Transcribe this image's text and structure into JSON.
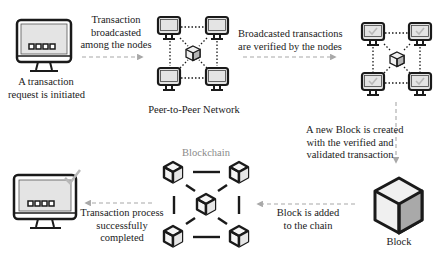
{
  "diagram": {
    "steps": [
      {
        "id": "request",
        "lines": [
          "A transaction",
          "request is initiated"
        ]
      },
      {
        "id": "broadcast",
        "lines": [
          "Transaction",
          "broadcasted",
          "among the nodes"
        ]
      },
      {
        "id": "p2p",
        "lines": [
          "Peer-to-Peer Network"
        ]
      },
      {
        "id": "verify",
        "lines": [
          "Broadcasted transactions",
          "are verified by the nodes"
        ]
      },
      {
        "id": "new_block",
        "lines": [
          "A new Block is created",
          "with the verified and",
          "validated transaction"
        ]
      },
      {
        "id": "block",
        "lines": [
          "Block"
        ]
      },
      {
        "id": "added",
        "lines": [
          "Block is added",
          "to the chain"
        ]
      },
      {
        "id": "blockchain",
        "lines": [
          "Blockchain"
        ]
      },
      {
        "id": "complete",
        "lines": [
          "Transaction process",
          "successfully",
          "completed"
        ]
      }
    ],
    "icons": {
      "start_computer": "computer-icon",
      "network": "peer-network-icon",
      "verified_network": "verified-network-icon",
      "block": "cube-icon",
      "chain": "blockchain-icon",
      "end_computer": "computer-check-icon"
    },
    "colors": {
      "stroke": "#1a1a1a",
      "screen_fill": "#e4e4e4",
      "arrow": "#a8a8a8",
      "check": "#b8b8b8",
      "cube_dark_face": "#a9a9a9",
      "cube_light_face": "#ededed"
    }
  }
}
